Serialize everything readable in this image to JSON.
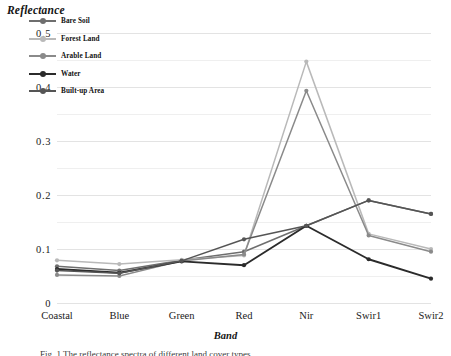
{
  "figure": {
    "y_axis_title": "Reflectance",
    "x_axis_title": "Band",
    "caption": "Fig. 1  The reflectance spectra of different land cover types"
  },
  "chart_data": {
    "type": "line",
    "title": "",
    "xlabel": "Band",
    "ylabel": "Reflectance",
    "categories": [
      "Coastal",
      "Blue",
      "Green",
      "Red",
      "Nir",
      "Swir1",
      "Swir2"
    ],
    "ylim": [
      0,
      0.5
    ],
    "ytick_labels": [
      "0",
      "0.1",
      "0.2",
      "0.3",
      "0.4",
      "0.5"
    ],
    "ytick_values": [
      0,
      0.1,
      0.2,
      0.3,
      0.4,
      0.5
    ],
    "grid": true,
    "grid_minor": true,
    "legend_position": "upper-left-inside",
    "markers": "circle",
    "series": [
      {
        "name": "Bare Soil",
        "color": "#6e6e6e",
        "values": [
          0.068,
          0.06,
          0.079,
          0.095,
          0.143,
          0.19,
          0.165
        ]
      },
      {
        "name": "Forest Land",
        "color": "#b9b9b9",
        "values": [
          0.079,
          0.072,
          0.08,
          0.088,
          0.447,
          0.128,
          0.1
        ]
      },
      {
        "name": "Arable Land",
        "color": "#8a8a8a",
        "values": [
          0.052,
          0.05,
          0.078,
          0.09,
          0.393,
          0.125,
          0.095
        ]
      },
      {
        "name": "Water",
        "color": "#2b2b2b",
        "values": [
          0.063,
          0.056,
          0.077,
          0.07,
          0.143,
          0.081,
          0.045
        ]
      },
      {
        "name": "Built-up Area",
        "color": "#555555",
        "values": [
          0.06,
          0.055,
          0.078,
          0.118,
          0.143,
          0.19,
          0.165
        ]
      }
    ]
  }
}
